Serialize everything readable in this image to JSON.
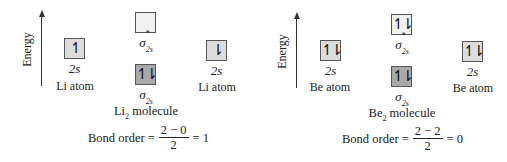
{
  "diagrams": [
    {
      "id": "li2",
      "axis_label": "Energy",
      "left_atom": {
        "orbital": "2s",
        "electrons": "↿",
        "label": "Li atom"
      },
      "right_atom": {
        "orbital": "2s",
        "electrons": "⇂",
        "label": "Li atom"
      },
      "antibonding": {
        "symbol": "σ",
        "superscript": "*",
        "subscript": "2s",
        "electrons": ""
      },
      "bonding": {
        "symbol": "σ",
        "subscript": "2s",
        "electrons": "↿⇂"
      },
      "molecule": {
        "name": "Li",
        "subscript": "2",
        "suffix": " molecule"
      },
      "bond_order": {
        "prefix": "Bond order =",
        "numerator": "2 − 0",
        "denominator": "2",
        "result": "= 1"
      }
    },
    {
      "id": "be2",
      "axis_label": "Energy",
      "left_atom": {
        "orbital": "2s",
        "electrons": "↿⇂",
        "label": "Be atom"
      },
      "right_atom": {
        "orbital": "2s",
        "electrons": "↿⇂",
        "label": "Be atom"
      },
      "antibonding": {
        "symbol": "σ",
        "superscript": "*",
        "subscript": "2s",
        "electrons": "↿⇂"
      },
      "bonding": {
        "symbol": "σ",
        "subscript": "2s",
        "electrons": "↿⇂"
      },
      "molecule": {
        "name": "Be",
        "subscript": "2",
        "suffix": " molecule"
      },
      "bond_order": {
        "prefix": "Bond order =",
        "numerator": "2 − 2",
        "denominator": "2",
        "result": "= 0"
      }
    }
  ],
  "colors": {
    "atomic_orbital_fill": "#dcdcdc",
    "bonding_orbital_fill": "#a9a9a9",
    "antibonding_orbital_fill": "#f1f1f1",
    "line": "#333333"
  }
}
